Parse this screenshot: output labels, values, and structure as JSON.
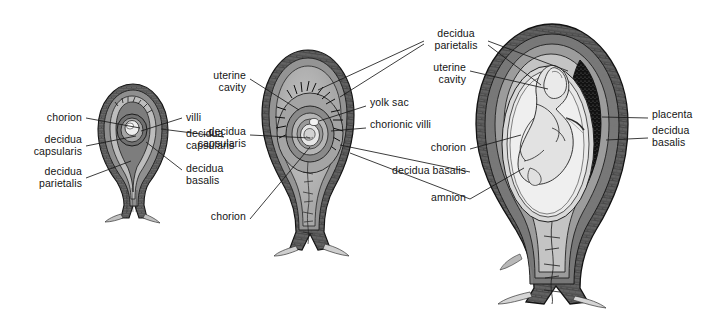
{
  "figure": {
    "background": "#ffffff",
    "text_color": "#141414",
    "line_color": "#1a1a1a",
    "width": 722,
    "height": 314
  },
  "specimens": [
    {
      "id": "specimen-early",
      "name": "early implantation stage",
      "x": 98,
      "y": 84,
      "w": 70,
      "h": 136
    },
    {
      "id": "specimen-mid",
      "name": "mid gestation stage",
      "x": 262,
      "y": 50,
      "w": 92,
      "h": 202
    },
    {
      "id": "specimen-late",
      "name": "late gestation stage with fetus",
      "x": 476,
      "y": 24,
      "w": 152,
      "h": 280
    }
  ],
  "labels": [
    {
      "id": "l1",
      "text": "chorion",
      "x": 82,
      "y": 118,
      "align": "right"
    },
    {
      "id": "l2",
      "text": "decidua\ncapsularis",
      "x": 82,
      "y": 144,
      "align": "right"
    },
    {
      "id": "l3",
      "text": "decidua\nparietalis",
      "x": 82,
      "y": 176,
      "align": "right"
    },
    {
      "id": "l4",
      "text": "villi",
      "x": 186,
      "y": 118,
      "align": "left"
    },
    {
      "id": "l5",
      "text": "decidua\ncapsularis",
      "x": 186,
      "y": 133,
      "align": "left"
    },
    {
      "id": "l6",
      "text": "decidua\nbasalis",
      "x": 186,
      "y": 168,
      "align": "left"
    },
    {
      "id": "l7",
      "text": "uterine\ncavity",
      "x": 246,
      "y": 75,
      "align": "right"
    },
    {
      "id": "l8",
      "text": "decidua\ncapsularis",
      "x": 246,
      "y": 131,
      "align": "right"
    },
    {
      "id": "l9",
      "text": "chorion",
      "x": 246,
      "y": 216,
      "align": "right"
    },
    {
      "id": "l10",
      "text": "decidua\nparietalis",
      "x": 455,
      "y": 33,
      "align": "center"
    },
    {
      "id": "l11",
      "text": "yolk sac",
      "x": 370,
      "y": 102,
      "align": "left"
    },
    {
      "id": "l12",
      "text": "chorionic villi",
      "x": 370,
      "y": 124,
      "align": "left"
    },
    {
      "id": "l13",
      "text": "uterine\ncavity",
      "x": 466,
      "y": 67,
      "align": "right"
    },
    {
      "id": "l14",
      "text": "chorion",
      "x": 466,
      "y": 147,
      "align": "right"
    },
    {
      "id": "l15",
      "text": "decidua basalis",
      "x": 466,
      "y": 170,
      "align": "right"
    },
    {
      "id": "l16",
      "text": "amnion",
      "x": 466,
      "y": 197,
      "align": "right"
    },
    {
      "id": "l17",
      "text": "placenta",
      "x": 652,
      "y": 114,
      "align": "left"
    },
    {
      "id": "l18",
      "text": "decidua\nbasalis",
      "x": 652,
      "y": 130,
      "align": "left"
    }
  ],
  "leaders": [
    {
      "from": "chorion",
      "d": "M86,118 L140,128"
    },
    {
      "from": "decidua-capsularis-1",
      "d": "M86,146 L136,136"
    },
    {
      "from": "decidua-parietalis-1",
      "d": "M86,178 L131,160"
    },
    {
      "from": "villi",
      "d": "M182,118 L141,131"
    },
    {
      "from": "decidua-capsularis-1r",
      "d": "M222,137 L160,128"
    },
    {
      "from": "decidua-basalis-1",
      "d": "M182,170 L145,141"
    },
    {
      "from": "uterine-cavity-2",
      "d": "M250,79 L297,109"
    },
    {
      "from": "decidua-capsularis-2",
      "d": "M250,135 L309,137"
    },
    {
      "from": "chorion-2",
      "d": "M250,218 L309,146"
    },
    {
      "from": "decidua-parietalis-a",
      "d": "M424,41 L320,90"
    },
    {
      "from": "decidua-parietalis-b",
      "d": "M424,44 L338,96"
    },
    {
      "from": "decidua-parietalis-c",
      "d": "M486,41 L566,70"
    },
    {
      "from": "decidua-parietalis-d",
      "d": "M486,45 L540,84"
    },
    {
      "from": "yolk-sac",
      "d": "M366,106 L318,120"
    },
    {
      "from": "chorionic-villi",
      "d": "M366,128 L330,130"
    },
    {
      "from": "uterine-cavity-3",
      "d": "M470,71 L546,88"
    },
    {
      "from": "chorion-3",
      "d": "M470,149 L520,134"
    },
    {
      "from": "decidua-basalis-3",
      "d": "M470,172 L339,144"
    },
    {
      "from": "amnion-a",
      "d": "M470,199 L349,152"
    },
    {
      "from": "amnion-b",
      "d": "M470,199 L522,167"
    },
    {
      "from": "placenta",
      "d": "M648,118 L601,116"
    },
    {
      "from": "decidua-basalis-r",
      "d": "M648,138 L605,139"
    }
  ]
}
